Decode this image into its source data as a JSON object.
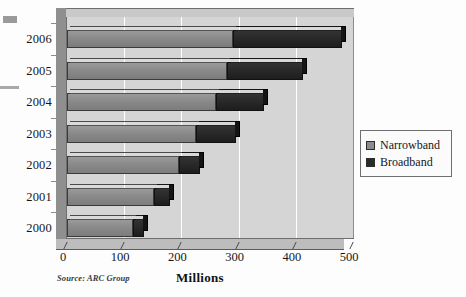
{
  "chart_data": {
    "type": "bar",
    "orientation": "horizontal",
    "stacked": true,
    "title": "",
    "xlabel": "Millions",
    "ylabel": "",
    "xlim": [
      0,
      500
    ],
    "xticks": [
      0,
      100,
      200,
      300,
      400,
      500
    ],
    "xtick_labels": [
      "0",
      "100",
      "200",
      "300",
      "400",
      "500"
    ],
    "categories": [
      "2006",
      "2005",
      "2004",
      "2003",
      "2002",
      "2001",
      "2000"
    ],
    "grid": "vertical",
    "legend_position": "right",
    "series": [
      {
        "name": "Narrowband",
        "color": "#8a8a8a",
        "values": [
          290,
          280,
          260,
          225,
          195,
          152,
          115
        ]
      },
      {
        "name": "Broadband",
        "color": "#2b2b2b",
        "values": [
          190,
          132,
          85,
          70,
          38,
          28,
          20
        ]
      }
    ],
    "totals": [
      480,
      412,
      345,
      295,
      233,
      180,
      135
    ],
    "source_note": "Source: ARC Group"
  },
  "axis": {
    "x_title": "Millions",
    "tick_labels": [
      "0",
      "100",
      "200",
      "300",
      "400",
      "500"
    ],
    "year_labels": [
      "2006",
      "2005",
      "2004",
      "2003",
      "2002",
      "2001",
      "2000"
    ]
  },
  "legend": {
    "items": [
      {
        "label": "Narrowband",
        "color": "#8a8a8a"
      },
      {
        "label": "Broadband",
        "color": "#2b2b2b"
      }
    ]
  },
  "footer": {
    "source": "Source: ARC Group"
  },
  "colors": {
    "narrowband": "#8a8a8a",
    "broadband": "#2b2b2b",
    "panel_background": "#d5d5d5",
    "gridline": "#ffffff"
  }
}
